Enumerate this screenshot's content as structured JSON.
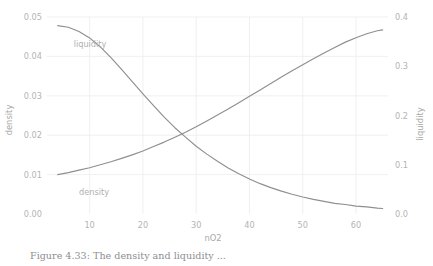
{
  "chart_data": {
    "type": "line",
    "title": "",
    "xlabel": "nO2",
    "ylabel": "density",
    "y2label": "liquidity",
    "xlim": [
      2,
      66
    ],
    "ylim": [
      0.0,
      0.05
    ],
    "y2lim": [
      0.0,
      0.4
    ],
    "grid": true,
    "legend": "inline-annotations",
    "xticks": [
      10,
      20,
      30,
      40,
      50,
      60
    ],
    "xticklabels": [
      "10",
      "20",
      "30",
      "40",
      "50",
      "60"
    ],
    "yticks": [
      0.0,
      0.01,
      0.02,
      0.03,
      0.04,
      0.05
    ],
    "yticklabels": [
      "0.00",
      "0.01",
      "0.02",
      "0.03",
      "0.04",
      "0.05"
    ],
    "y2ticks": [
      0.0,
      0.1,
      0.2,
      0.3,
      0.4
    ],
    "y2ticklabels": [
      "0.0",
      "0.1",
      "0.2",
      "0.3",
      "0.4"
    ],
    "annotations": [
      {
        "text": "liquidity",
        "x": 7,
        "y": 0.0425,
        "axis": "left"
      },
      {
        "text": "density",
        "x": 8,
        "y": 0.0048,
        "axis": "left"
      }
    ],
    "series": [
      {
        "name": "density",
        "axis": "left",
        "color": "#8f8f93",
        "x": [
          4,
          6,
          8,
          10,
          12,
          14,
          16,
          18,
          20,
          22,
          24,
          26,
          28,
          30,
          32,
          34,
          36,
          38,
          40,
          42,
          44,
          46,
          48,
          50,
          52,
          54,
          56,
          58,
          60,
          62,
          64,
          65
        ],
        "y": [
          0.0478,
          0.0474,
          0.0463,
          0.0447,
          0.0424,
          0.0397,
          0.0367,
          0.0336,
          0.0305,
          0.0275,
          0.0246,
          0.0219,
          0.0195,
          0.0172,
          0.0152,
          0.0134,
          0.0117,
          0.0102,
          0.0089,
          0.0077,
          0.0067,
          0.0058,
          0.005,
          0.0043,
          0.0037,
          0.0032,
          0.0027,
          0.0024,
          0.002,
          0.0018,
          0.0015,
          0.0014
        ]
      },
      {
        "name": "liquidity",
        "axis": "right",
        "color": "#8f8f93",
        "x": [
          4,
          6,
          8,
          10,
          12,
          14,
          16,
          18,
          20,
          22,
          24,
          26,
          28,
          30,
          32,
          34,
          36,
          38,
          40,
          42,
          44,
          46,
          48,
          50,
          52,
          54,
          56,
          58,
          60,
          62,
          64,
          65
        ],
        "y": [
          0.08,
          0.084,
          0.089,
          0.094,
          0.1,
          0.106,
          0.113,
          0.12,
          0.128,
          0.137,
          0.146,
          0.156,
          0.166,
          0.177,
          0.189,
          0.201,
          0.213,
          0.226,
          0.239,
          0.252,
          0.265,
          0.278,
          0.291,
          0.303,
          0.315,
          0.327,
          0.338,
          0.349,
          0.358,
          0.366,
          0.372,
          0.374
        ]
      }
    ]
  },
  "caption": {
    "text": "Figure 4.33:  The density and liquidity ..."
  }
}
